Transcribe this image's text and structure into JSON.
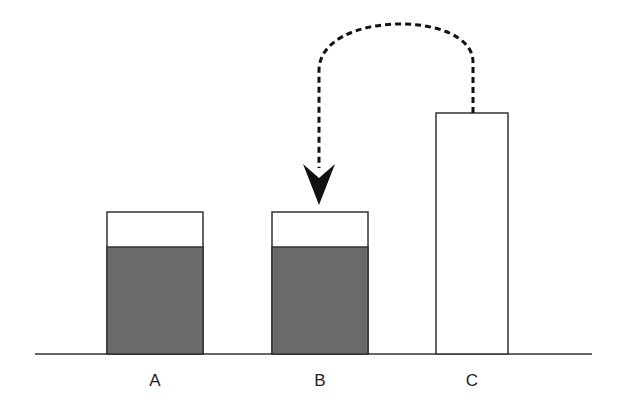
{
  "diagram": {
    "colors": {
      "fill": "#6a6a6a",
      "stroke": "#333333",
      "empty": "#ffffff"
    },
    "containers": [
      {
        "label": "A",
        "filled": true
      },
      {
        "label": "B",
        "filled": true
      },
      {
        "label": "C",
        "filled": false
      }
    ],
    "arrow": {
      "from": "C",
      "to": "B",
      "style": "dashed"
    }
  }
}
